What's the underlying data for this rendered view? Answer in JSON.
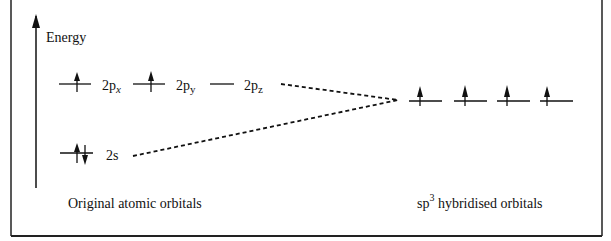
{
  "axis": {
    "label": "Energy"
  },
  "atomic_orbitals": [
    {
      "name": "2p",
      "sub": "x",
      "electrons": "up"
    },
    {
      "name": "2p",
      "sub": "y",
      "electrons": "up"
    },
    {
      "name": "2p",
      "sub": "z",
      "electrons": "none"
    },
    {
      "name": "2s",
      "sub": "",
      "electrons": "pair"
    }
  ],
  "hybrid_orbitals": {
    "count": 4,
    "electrons": [
      "up",
      "up",
      "up",
      "up"
    ]
  },
  "captions": {
    "left": "Original atomic orbitals",
    "right_prefix": "sp",
    "right_sup": "3",
    "right_suffix": " hybridised orbitals"
  },
  "colors": {
    "line": "#111111",
    "background": "#ffffff"
  }
}
